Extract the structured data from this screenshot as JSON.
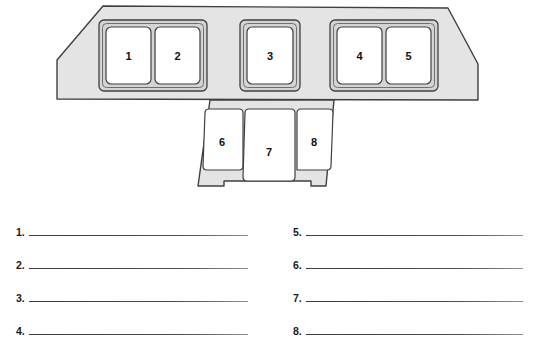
{
  "page": {
    "background_color": "#ffffff"
  },
  "diagram": {
    "name": "cockpit-instrument-panel-diagram",
    "panel_fill": "#e3e3e3",
    "bezel_fill": "#d2d2d2",
    "display_fill": "#ffffff",
    "outline_color": "#3a3a3a",
    "callouts": [
      {
        "id": 1,
        "label": "1",
        "group": "upper-left-pair"
      },
      {
        "id": 2,
        "label": "2",
        "group": "upper-left-pair"
      },
      {
        "id": 3,
        "label": "3",
        "group": "upper-center"
      },
      {
        "id": 4,
        "label": "4",
        "group": "upper-right-pair"
      },
      {
        "id": 5,
        "label": "5",
        "group": "upper-right-pair"
      },
      {
        "id": 6,
        "label": "6",
        "group": "lower-console"
      },
      {
        "id": 7,
        "label": "7",
        "group": "lower-console"
      },
      {
        "id": 8,
        "label": "8",
        "group": "lower-console"
      }
    ]
  },
  "answers": {
    "left_column": [
      {
        "number": "1.",
        "value": ""
      },
      {
        "number": "2.",
        "value": ""
      },
      {
        "number": "3.",
        "value": ""
      },
      {
        "number": "4.",
        "value": ""
      }
    ],
    "right_column": [
      {
        "number": "5.",
        "value": ""
      },
      {
        "number": "6.",
        "value": ""
      },
      {
        "number": "7.",
        "value": ""
      },
      {
        "number": "8.",
        "value": ""
      }
    ]
  }
}
